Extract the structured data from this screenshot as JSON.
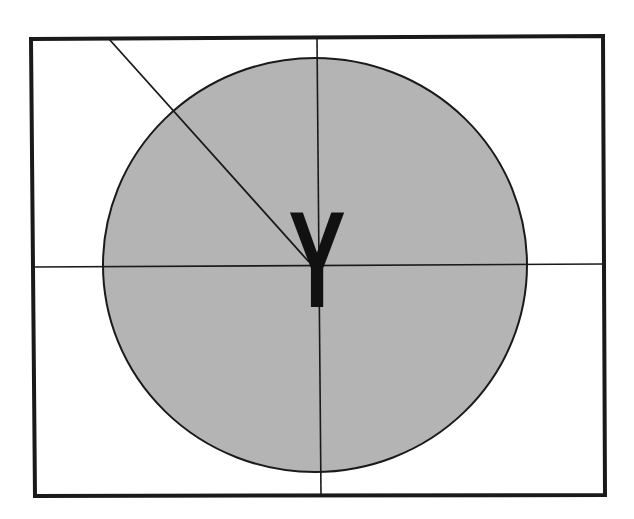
{
  "diagram": {
    "center_label": "Y",
    "colors": {
      "background": "#ffffff",
      "circle_fill": "#b4b4b4",
      "stroke": "#1a1a1a",
      "label": "#111111"
    }
  }
}
